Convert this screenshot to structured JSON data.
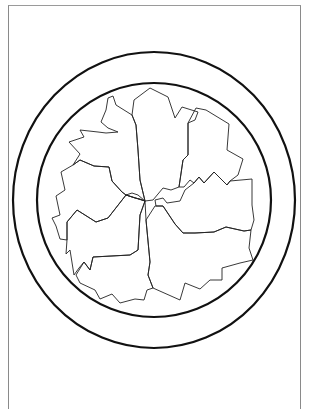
{
  "page": {
    "colors": {
      "background": "#ffffff",
      "frame": "#8a8a8a",
      "rings": "#111111",
      "pieces": "#222222"
    }
  },
  "drawing": {
    "outer_ring": {
      "cx": 154,
      "cy": 200,
      "rx": 141,
      "ry": 148
    },
    "inner_ring": {
      "cx": 154,
      "cy": 200,
      "rx": 117,
      "ry": 117
    },
    "hub": {
      "x": 145,
      "y": 201
    },
    "pieces": [
      {
        "name": "top-center",
        "points": "145,201 140,180 138,150 136,125 132,115 134,100 150,88 168,97 175,118 182,107 198,112 195,120 188,123 188,155 183,160 179,187 171,190 163,188 153,200"
      },
      {
        "name": "top-right",
        "points": "188,123 196,108 206,110 229,124 227,150 243,159 238,175 230,181 227,185 214,172 204,183 199,177 194,183 190,180 184,187 179,187 183,160 188,155"
      },
      {
        "name": "right",
        "points": "227,185 230,181 252,179 252,205 254,220 251,230 244,231 226,227 214,232 195,233 183,233 175,224 163,206 156,206 155,200 163,198 167,203 180,201 185,190 194,183 199,177 204,183 214,172"
      },
      {
        "name": "bottom-right",
        "points": "155,206 156,206 163,206 175,224 183,233 195,233 214,232 226,227 244,231 251,230 249,248 253,260 240,263 222,268 222,280 210,280 200,289 185,283 180,300 153,288 148,275 150,262 146,220"
      },
      {
        "name": "bottom-left",
        "points": "146,220 145,201 140,215 138,250 130,255 93,257 90,270 84,262 76,275 80,283 95,290 100,299 112,294 120,303 135,299 144,300 147,290 153,288 148,275 150,262"
      },
      {
        "name": "left",
        "points": "145,201 138,195 132,193 126,195 108,218 96,222 77,210 67,222 67,240 66,254 70,250 74,275 79,268 84,262 90,270 93,257 130,255 138,250 140,215"
      },
      {
        "name": "upper-left",
        "points": "145,201 140,199 135,198 126,195 122,192 112,181 109,167 94,166 80,160 73,165 61,172 65,190 56,196 60,215 52,218 56,226 60,239 67,240 67,222 77,210 96,222 108,218 126,195"
      },
      {
        "name": "top-left",
        "points": "126,195 122,192 112,181 109,167 94,166 80,160 73,165 80,154 69,142 84,137 80,130 98,132 106,133 118,132 108,128 101,122 106,110 108,98 113,96 116,105 132,115 136,125 138,150 140,180 145,201"
      }
    ]
  }
}
